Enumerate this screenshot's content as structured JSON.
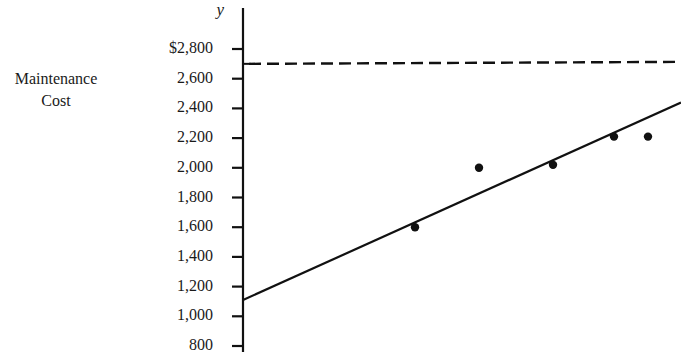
{
  "chart_data": {
    "type": "scatter",
    "title": "",
    "xlabel": "",
    "ylabel": "Maintenance Cost",
    "y_variable": "y",
    "ylim": [
      800,
      2900
    ],
    "y_ticks": [
      {
        "value": 2800,
        "label": "$2,800"
      },
      {
        "value": 2600,
        "label": "2,600"
      },
      {
        "value": 2400,
        "label": "2,400"
      },
      {
        "value": 2200,
        "label": "2,200"
      },
      {
        "value": 2000,
        "label": "2,000"
      },
      {
        "value": 1800,
        "label": "1,800"
      },
      {
        "value": 1600,
        "label": "1,600"
      },
      {
        "value": 1400,
        "label": "1,400"
      },
      {
        "value": 1200,
        "label": "1,200"
      },
      {
        "value": 1000,
        "label": "1,000"
      },
      {
        "value": 800,
        "label": "800"
      }
    ],
    "grid": false,
    "legend": null,
    "points": [
      {
        "x_px": 415,
        "y": 1600
      },
      {
        "x_px": 479,
        "y": 2000
      },
      {
        "x_px": 553,
        "y": 2020
      },
      {
        "x_px": 614,
        "y": 2210
      },
      {
        "x_px": 648,
        "y": 2210
      }
    ],
    "regression_line": {
      "style": "solid",
      "y_at_axis": 1110,
      "y_at_right_edge": 2440
    },
    "reference_line": {
      "style": "dashed",
      "y": 2700
    }
  },
  "labels": {
    "ylabel_line1": "Maintenance",
    "ylabel_line2": "Cost",
    "y_variable": "y"
  }
}
